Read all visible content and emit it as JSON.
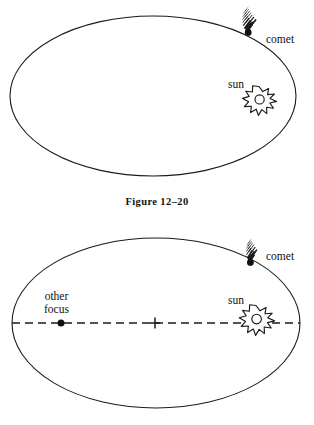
{
  "figure": {
    "caption": "Figure 12–20",
    "line_color": "#1a1a1a",
    "background": "#ffffff"
  },
  "top_diagram": {
    "name": "comet-orbit-ellipse-top",
    "ellipse": {
      "cx": 153,
      "cy": 96,
      "rx": 143,
      "ry": 80
    },
    "comet": {
      "label": "comet",
      "x": 248,
      "y": 32
    },
    "sun": {
      "label": "sun",
      "x": 259,
      "y": 104
    }
  },
  "bottom_diagram": {
    "name": "comet-orbit-ellipse-bottom",
    "ellipse": {
      "cx": 156,
      "cy": 323,
      "rx": 144,
      "ry": 85
    },
    "comet": {
      "label": "comet",
      "x": 250,
      "y": 262
    },
    "sun": {
      "label": "sun",
      "x": 256,
      "y": 323
    },
    "other_focus": {
      "label": "other\nfocus",
      "x": 61,
      "y": 323
    },
    "center_mark": {
      "x": 155,
      "y": 323
    },
    "major_axis": {
      "style": "dashed",
      "x1": 12,
      "x2": 300,
      "y": 323
    }
  }
}
